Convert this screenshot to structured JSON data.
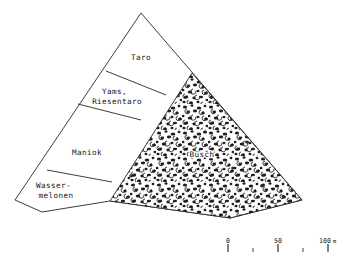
{
  "figure": {
    "kind": "hand-drawn-schematic-map",
    "caption_present": false,
    "background_color": "#ffffff",
    "ink_color": "#262626"
  },
  "map": {
    "title": "",
    "fields": [
      {
        "id": "taro",
        "label": "Taro",
        "label_lines": [
          "Taro"
        ],
        "label_x": 141,
        "label_y": 58,
        "polygon": "141,13 192,73 166,95 106,71"
      },
      {
        "id": "yams-riesentaro",
        "label": "Yams, Riesentaro",
        "label_lines": [
          "Yams,",
          "Riesentaro"
        ],
        "label_x": 117,
        "label_y": 96,
        "polygon": "106,71 166,95 141,120 78,104"
      },
      {
        "id": "maniok",
        "label": "Maniok",
        "label_lines": [
          "Maniok"
        ],
        "label_x": 87,
        "label_y": 153,
        "polygon": "78,104 141,120 112,182 47,170"
      },
      {
        "id": "wassermelonen",
        "label": "Wasser-melonen",
        "label_lines": [
          "Wasser-",
          "melonen"
        ],
        "label_x": 56,
        "label_y": 190,
        "polygon": "47,170 112,182 110,201 42,212 15,200"
      }
    ],
    "bush": {
      "id": "busch",
      "label": "Busch",
      "label_x": 202,
      "label_y": 155,
      "texture": "stipple-blob",
      "polygon": "192,73 302,200 230,218 110,201"
    },
    "outline": "141,13 302,200 230,218 110,201 42,212 15,200"
  },
  "scale_bar": {
    "unit": "m",
    "ticks": [
      {
        "value": "0",
        "x": 228,
        "type": "major"
      },
      {
        "value": "",
        "x": 253,
        "type": "minor"
      },
      {
        "value": "50",
        "x": 278,
        "type": "major"
      },
      {
        "value": "",
        "x": 303,
        "type": "minor"
      },
      {
        "value": "100",
        "x": 328,
        "type": "major"
      }
    ],
    "labels": [
      {
        "text": "0",
        "x": 228,
        "y": 243
      },
      {
        "text": "50",
        "x": 278,
        "y": 243
      },
      {
        "text": "100",
        "x": 327,
        "y": 243
      }
    ],
    "unit_x": 331,
    "unit_y": 243
  }
}
